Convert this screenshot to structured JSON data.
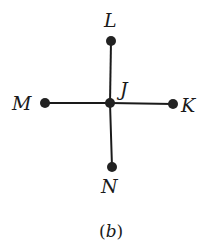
{
  "diagram": {
    "type": "graph",
    "caption": {
      "open": "(",
      "letter": "b",
      "close": ")"
    },
    "nodes": [
      {
        "id": "J",
        "label": "J",
        "x": 110,
        "y": 103
      },
      {
        "id": "L",
        "label": "L",
        "x": 111,
        "y": 41
      },
      {
        "id": "M",
        "label": "M",
        "x": 45,
        "y": 103
      },
      {
        "id": "K",
        "label": "K",
        "x": 173,
        "y": 104
      },
      {
        "id": "N",
        "label": "N",
        "x": 112,
        "y": 167
      }
    ],
    "edges": [
      {
        "from": "J",
        "to": "L"
      },
      {
        "from": "J",
        "to": "M"
      },
      {
        "from": "J",
        "to": "K"
      },
      {
        "from": "J",
        "to": "N"
      }
    ],
    "colors": {
      "line": "#1a1a1a",
      "node": "#222222"
    }
  }
}
